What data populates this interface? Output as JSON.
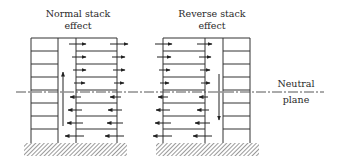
{
  "diagram": {
    "left_title_line1": "Normal stack",
    "left_title_line2": "effect",
    "right_title_line1": "Reverse stack",
    "right_title_line2": "effect",
    "neutral_label_line1": "Neutral",
    "neutral_label_line2": "plane",
    "colors": {
      "line": "#333333",
      "hatch": "#555555"
    },
    "left_building": {
      "name": "Normal stack effect",
      "floors": 8,
      "shaft_flow": "upward",
      "upper_floors_flow": "outward (right)",
      "lower_floors_flow": "inward (left)"
    },
    "right_building": {
      "name": "Reverse stack effect",
      "floors": 8,
      "shaft_flow": "downward",
      "upper_floors_flow": "inward (right)",
      "lower_floors_flow": "outward (left)"
    }
  }
}
